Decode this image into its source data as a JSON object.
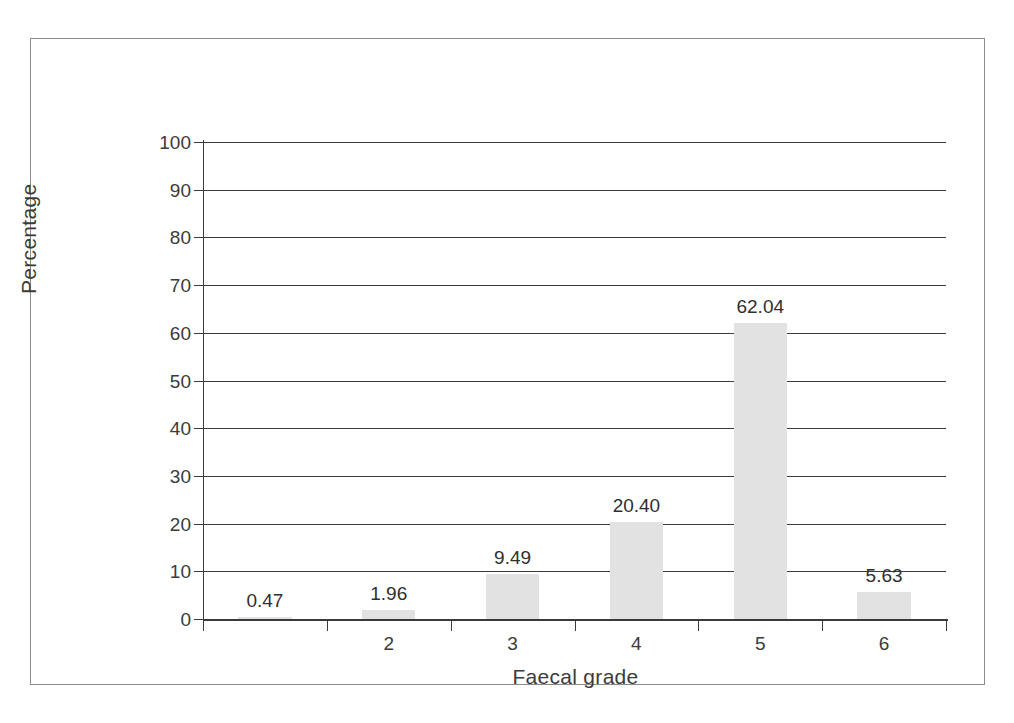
{
  "chart_data": {
    "type": "bar",
    "title": "",
    "xlabel": "Faecal grade",
    "ylabel": "Percentage",
    "categories": [
      "1",
      "2",
      "3",
      "4",
      "5",
      "6"
    ],
    "visible_tick_labels": [
      "",
      "2",
      "3",
      "4",
      "5",
      "6"
    ],
    "values": [
      0.47,
      1.96,
      9.49,
      20.4,
      62.04,
      5.63
    ],
    "value_labels": [
      "0.47",
      "1.96",
      "9.49",
      "20.40",
      "62.04",
      "5.63"
    ],
    "ylim": [
      0,
      100
    ],
    "ytick_labels": [
      "0",
      "10",
      "20",
      "30",
      "40",
      "50",
      "60",
      "70",
      "80",
      "90",
      "100"
    ],
    "ytick_values": [
      0,
      10,
      20,
      30,
      40,
      50,
      60,
      70,
      80,
      90,
      100
    ],
    "grid": true,
    "legend": false,
    "bar_color": "#e2e2e2",
    "axis_color": "#3a3a3a",
    "text_color": "#3b3b3b",
    "frame_color": "#8c8c8c"
  }
}
